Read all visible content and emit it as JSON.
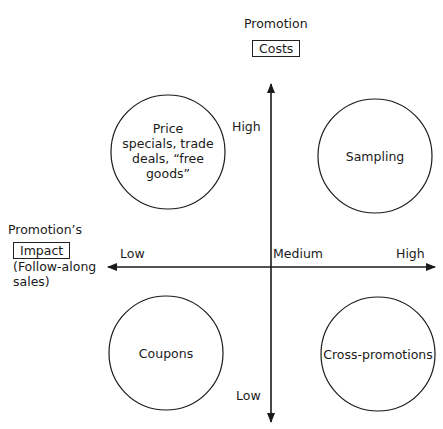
{
  "top_label": {
    "line1": "Promotion",
    "boxed": "Costs"
  },
  "left_label": {
    "line1": "Promotion’s",
    "boxed": "Impact",
    "line3": "(Follow-along",
    "line4": "sales)"
  },
  "axes": {
    "vertical": {
      "high": "High",
      "low": "Low"
    },
    "horizontal": {
      "low": "Low",
      "medium": "Medium",
      "high": "High"
    }
  },
  "quadrants": {
    "top_left": {
      "lines": [
        "Price",
        "specials, trade",
        "deals, “free",
        "goods”"
      ]
    },
    "top_right": {
      "label": "Sampling"
    },
    "bottom_left": {
      "label": "Coupons"
    },
    "bottom_right": {
      "label": "Cross-promotions"
    }
  },
  "colors": {
    "line": "#1a1a1a",
    "background": "#ffffff"
  }
}
